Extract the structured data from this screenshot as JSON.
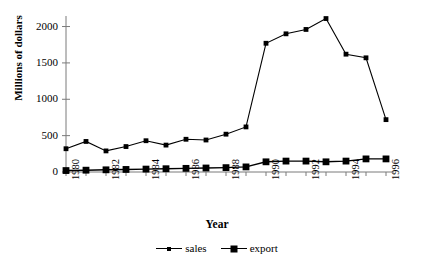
{
  "chart_data": {
    "type": "line",
    "title": "",
    "xlabel": "Year",
    "ylabel": "Millions of dollars",
    "x": [
      1980,
      1981,
      1982,
      1983,
      1984,
      1985,
      1986,
      1987,
      1988,
      1989,
      1990,
      1991,
      1992,
      1993,
      1994,
      1995,
      1996
    ],
    "xlim": [
      1980,
      1996
    ],
    "ylim": [
      0,
      2200
    ],
    "yticks": [
      0,
      500,
      1000,
      1500,
      2000
    ],
    "xticks": [
      1980,
      1982,
      1984,
      1986,
      1988,
      1990,
      1992,
      1994,
      1996
    ],
    "xtick_labels": [
      "1980",
      "1982",
      "1984",
      "1986",
      "1988",
      "1990",
      "1992",
      "1994",
      "1996"
    ],
    "ytick_labels": [
      "0",
      "500",
      "1000",
      "1500",
      "2000"
    ],
    "grid": false,
    "legend_position": "bottom-center",
    "series": [
      {
        "name": "sales",
        "marker": "square-small",
        "color": "#000000",
        "values": [
          320,
          420,
          290,
          350,
          430,
          370,
          450,
          440,
          520,
          620,
          1770,
          1900,
          1960,
          2110,
          1620,
          1570,
          720
        ]
      },
      {
        "name": "export",
        "marker": "square-large",
        "color": "#000000",
        "values": [
          20,
          25,
          30,
          35,
          40,
          45,
          50,
          55,
          60,
          70,
          140,
          150,
          150,
          140,
          150,
          180,
          180
        ]
      }
    ]
  },
  "legend": {
    "entries": [
      {
        "label": "sales"
      },
      {
        "label": "export"
      }
    ]
  },
  "axis": {
    "y_title": "Millions of dollars",
    "x_title": "Year"
  }
}
